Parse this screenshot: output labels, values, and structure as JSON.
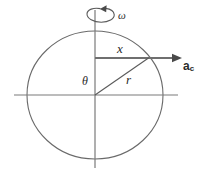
{
  "figure": {
    "type": "physics-diagram",
    "background_color": "#ffffff",
    "line_color": "#5a5a5a",
    "label_color": "#2b2b2b",
    "width": 209,
    "height": 175
  },
  "geometry": {
    "center": {
      "x": 95,
      "y": 95
    },
    "circle_radius_x": 68,
    "circle_radius_y": 64,
    "vertical_axis": {
      "x": 95,
      "y_top": 10,
      "y_bottom": 168
    },
    "horizontal_axis": {
      "y": 95,
      "x_left": 14,
      "x_right": 178
    },
    "point_on_circle": {
      "x": 148,
      "y": 58
    },
    "ac_arrow": {
      "x_start": 95,
      "y": 58,
      "x_end": 181
    },
    "rotation_arc": {
      "cx": 100,
      "cy": 15,
      "rx": 13,
      "ry": 7
    }
  },
  "labels": {
    "omega": "ω",
    "x": "x",
    "r": "r",
    "theta": "θ",
    "ac_base": "a",
    "ac_subscript": "c"
  },
  "icon_names": {
    "rotation_arrow": "rotation-arrow-icon",
    "acceleration_arrow": "acceleration-arrow-icon"
  }
}
